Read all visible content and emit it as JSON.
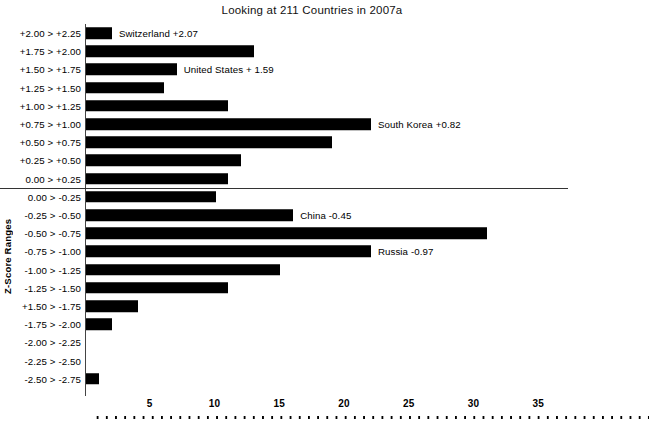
{
  "chart_data": {
    "type": "bar",
    "orientation": "horizontal",
    "title": "Looking at 211 Countries in 2007a",
    "xlabel": "",
    "ylabel": "Z-Score Ranges",
    "xlim": [
      0,
      36
    ],
    "ylim": null,
    "grid": false,
    "legend": null,
    "xticks": [
      5,
      10,
      15,
      20,
      25,
      30,
      35
    ],
    "categories": [
      "+2.00 > +2.25",
      "+1.75 > +2.00",
      "+1.50 > +1.75",
      "+1.25 > +1.50",
      "+1.00 > +1.25",
      "+0.75 > +1.00",
      "+0.50 > +0.75",
      "+0.25 > +0.50",
      "0.00 > +0.25",
      "0.00 > -0.25",
      "-0.25 > -0.50",
      "-0.50 > -0.75",
      "-0.75 > -1.00",
      "-1.00 > -1.25",
      "-1.25 > -1.50",
      "+1.50 > -1.75",
      "-1.75 > -2.00",
      "-2.00 > -2.25",
      "-2.25 > -2.50",
      "-2.50 > -2.75"
    ],
    "values": [
      2,
      13,
      7,
      6,
      11,
      22,
      19,
      12,
      11,
      10,
      16,
      31,
      22,
      15,
      11,
      4,
      2,
      0,
      0,
      1
    ],
    "annotations": [
      {
        "category": "+2.00 > +2.25",
        "text": "Switzerland +2.07"
      },
      {
        "category": "+1.50 > +1.75",
        "text": "United States + 1.59"
      },
      {
        "category": "+0.75 > +1.00",
        "text": "South Korea +0.82"
      },
      {
        "category": "-0.25 > -0.50",
        "text": "China -0.45"
      },
      {
        "category": "-0.75 > -1.00",
        "text": "Russia -0.97"
      }
    ],
    "divider_after_category": "0.00 > +0.25",
    "colors": {
      "bar": "#000000",
      "axis": "#333333",
      "background": "#ffffff"
    }
  }
}
